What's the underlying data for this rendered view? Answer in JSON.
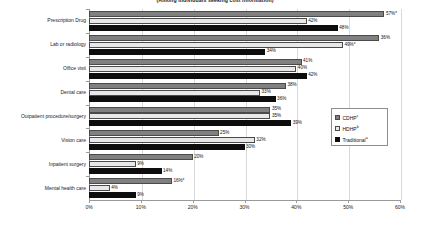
{
  "chart_data": {
    "type": "bar",
    "orientation": "horizontal",
    "title": "(Among individuals seeking cost information)",
    "xlabel": "",
    "ylabel": "",
    "xlim": [
      0,
      60
    ],
    "xticks": [
      "0%",
      "10%",
      "20%",
      "30%",
      "40%",
      "50%",
      "60%"
    ],
    "grid": true,
    "legend_position": "right-middle",
    "categories": [
      "Prescription Drug",
      "Lab or radiology",
      "Office visit",
      "Dental care",
      "Outpatient procedure/surgery",
      "Vision care",
      "Inpatient surgery",
      "Mental health care"
    ],
    "series": [
      {
        "name": "CDHP",
        "superscript": "c",
        "color": "#808080",
        "values": [
          57,
          56,
          41,
          38,
          35,
          25,
          20,
          16
        ],
        "labels": [
          "57%*",
          "36%",
          "41%",
          "38%",
          "35%",
          "25%",
          "20%",
          "16%*"
        ]
      },
      {
        "name": "HDHP",
        "superscript": "b",
        "color": "#e8e8e8",
        "values": [
          42,
          49,
          40,
          33,
          35,
          32,
          9,
          4
        ],
        "labels": [
          "42%",
          "49%*",
          "40%",
          "33%",
          "35%",
          "32%",
          "9%",
          "4%"
        ]
      },
      {
        "name": "Traditional",
        "superscript": "a",
        "color": "#0d0d0d",
        "values": [
          48,
          34,
          42,
          36,
          39,
          30,
          14,
          9
        ],
        "labels": [
          "48%",
          "34%",
          "42%",
          "36%",
          "39%",
          "30%",
          "14%",
          "9%"
        ]
      }
    ]
  },
  "legend": {
    "items": [
      {
        "label": "CDHP",
        "sup": "c"
      },
      {
        "label": "HDHP",
        "sup": "b"
      },
      {
        "label": "Traditional",
        "sup": "a"
      }
    ]
  }
}
